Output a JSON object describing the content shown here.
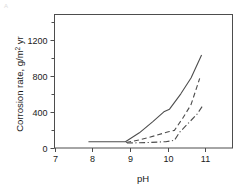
{
  "figure": {
    "corner_mark": "A",
    "background_color": "#ffffff",
    "frame_color": "#4d4d4d",
    "text_color": "#1a1a1a"
  },
  "chart_data": {
    "type": "line",
    "title": "",
    "subtitle": "",
    "xlabel": "pH",
    "ylabel": "Corrosion rate, g/m² yr",
    "ylabel_parts": {
      "prefix": "Corrosion rate, g/m",
      "superscript": "2",
      "suffix": " yr"
    },
    "xlim": [
      7,
      11.72
    ],
    "ylim": [
      0,
      1478
    ],
    "xticks": [
      7,
      8,
      9,
      10,
      11
    ],
    "xtick_labels": [
      "7",
      "8",
      "9",
      "10",
      "11"
    ],
    "yticks": [
      0,
      400,
      800,
      1200
    ],
    "ytick_labels": [
      "0",
      "400",
      "800",
      "1200"
    ],
    "yticks_minor": [
      200,
      600,
      1000,
      1400
    ],
    "grid": false,
    "legend": null,
    "legend_position": "none",
    "annotations": [],
    "series": [
      {
        "name": "curve-solid-upper",
        "style": "solid",
        "dash": "none",
        "color": "#4d4d4d",
        "points": [
          {
            "x": 7.9,
            "y": 70
          },
          {
            "x": 8.88,
            "y": 70
          },
          {
            "x": 9.25,
            "y": 168
          },
          {
            "x": 9.6,
            "y": 290
          },
          {
            "x": 9.9,
            "y": 400
          },
          {
            "x": 10.05,
            "y": 430
          },
          {
            "x": 10.35,
            "y": 600
          },
          {
            "x": 10.62,
            "y": 775
          },
          {
            "x": 10.9,
            "y": 1030
          }
        ]
      },
      {
        "name": "curve-dashed-middle",
        "style": "dashed",
        "dash": "5,3",
        "color": "#4d4d4d",
        "points": [
          {
            "x": 8.9,
            "y": 60
          },
          {
            "x": 9.3,
            "y": 95
          },
          {
            "x": 9.7,
            "y": 140
          },
          {
            "x": 10.02,
            "y": 180
          },
          {
            "x": 10.18,
            "y": 195
          },
          {
            "x": 10.4,
            "y": 330
          },
          {
            "x": 10.62,
            "y": 480
          },
          {
            "x": 10.85,
            "y": 770
          }
        ]
      },
      {
        "name": "curve-dashdot-lower",
        "style": "dash-dot",
        "dash": "6,2.5,1.2,2.5",
        "color": "#4d4d4d",
        "points": [
          {
            "x": 8.92,
            "y": 55
          },
          {
            "x": 9.45,
            "y": 60
          },
          {
            "x": 9.95,
            "y": 70
          },
          {
            "x": 10.18,
            "y": 85
          },
          {
            "x": 10.32,
            "y": 175
          },
          {
            "x": 10.55,
            "y": 275
          },
          {
            "x": 10.78,
            "y": 375
          },
          {
            "x": 10.95,
            "y": 480
          }
        ]
      }
    ]
  }
}
